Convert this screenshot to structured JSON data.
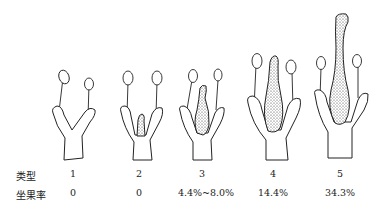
{
  "figure": {
    "row_headers": {
      "type": "类型",
      "fruit_set_rate": "坐果率"
    },
    "columns": [
      {
        "type": "1",
        "fruit_set_rate": "0",
        "pistil_size": "none"
      },
      {
        "type": "2",
        "fruit_set_rate": "0",
        "pistil_size": "tiny"
      },
      {
        "type": "3",
        "fruit_set_rate": "4.4%~8.0%",
        "pistil_size": "small"
      },
      {
        "type": "4",
        "fruit_set_rate": "14.4%",
        "pistil_size": "medium"
      },
      {
        "type": "5",
        "fruit_set_rate": "34.3%",
        "pistil_size": "large"
      }
    ]
  }
}
